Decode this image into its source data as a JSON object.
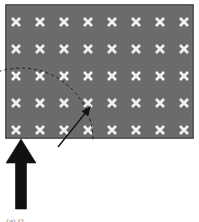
{
  "figure": {
    "background_color": "#ffffff",
    "field": {
      "label": "sensor-field",
      "fill_color": "#6b6b6b",
      "border_color": "#2b2b2b",
      "x": 6,
      "y": 5,
      "width": 187,
      "height": 133
    },
    "grid": {
      "label": "node-grid",
      "marker_glyph": "x",
      "marker_color": "#f2f2f2",
      "columns": 8,
      "rows": 5,
      "total_nodes": 40,
      "first_x": 16,
      "first_y": 22,
      "step_x": 24,
      "step_y": 27,
      "marker_size": 8,
      "highlighted_node": {
        "label": "target-node",
        "column": 4,
        "row": 4
      }
    },
    "coverage_arc": {
      "label": "coverage-radius-arc",
      "style": "dashed",
      "color": "#1f1f1f",
      "dash_pattern": "3,3",
      "stroke_width": 1,
      "center_x": 21,
      "center_y": 140,
      "radius": 72,
      "start_angle_deg": 180,
      "end_angle_deg": 360
    },
    "pointer_arrow": {
      "label": "pointer-arrow",
      "color": "#111111",
      "stroke_width": 1.4,
      "tail_x": 58,
      "tail_y": 147,
      "tip_x": 91,
      "tip_y": 106
    },
    "entry_arrow": {
      "label": "entry-arrow",
      "color": "#111111",
      "shaft_x": 21,
      "shaft_top_y": 152,
      "shaft_bottom_y": 209,
      "shaft_width": 11,
      "head_width": 30,
      "head_height": 24,
      "tip_y": 139
    },
    "caption": "(a) t1"
  }
}
